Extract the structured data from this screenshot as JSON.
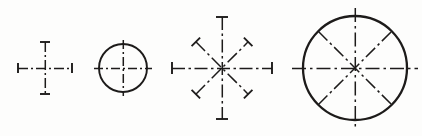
{
  "sheet": {
    "title": "Centerline and center-mark figures",
    "width": 422,
    "height": 136,
    "background_color": "#fdfdfc",
    "ink_color": "#1d1b1a"
  },
  "figures": [
    {
      "id": "fig-1",
      "name": "center-cross",
      "label": "Center cross with end ticks",
      "center": {
        "x": 45,
        "y": 68
      },
      "has_circle": false,
      "circle_radius": 0,
      "axes": [
        "horizontal",
        "vertical"
      ],
      "axis_half_length_h": 27,
      "axis_half_length_v": 26,
      "tick_half_length": 5,
      "end_marks": 4
    },
    {
      "id": "fig-2",
      "name": "small-circle-with-centerlines",
      "label": "Small circle with two centerlines",
      "center": {
        "x": 123,
        "y": 68
      },
      "has_circle": true,
      "circle_radius": 24,
      "axes": [
        "horizontal",
        "vertical"
      ],
      "axis_half_length_h": 29,
      "axis_half_length_v": 28,
      "tick_half_length": 0,
      "end_marks": 0
    },
    {
      "id": "fig-3",
      "name": "eight-spoke-star",
      "label": "Eight-spoke centerline star with end ticks",
      "center": {
        "x": 222,
        "y": 68
      },
      "has_circle": false,
      "circle_radius": 0,
      "axes": [
        "horizontal",
        "vertical",
        "diagonal-45",
        "diagonal-135"
      ],
      "axis_half_length_h": 50,
      "axis_half_length_v": 51,
      "axis_half_length_d": 37,
      "tick_half_length": 6,
      "end_marks": 8
    },
    {
      "id": "fig-4",
      "name": "large-circle-with-eight-centerlines",
      "label": "Large circle with eight centerlines",
      "center": {
        "x": 355,
        "y": 68
      },
      "has_circle": true,
      "circle_radius": 52,
      "axes": [
        "horizontal",
        "vertical",
        "diagonal-45",
        "diagonal-135"
      ],
      "axis_half_length_h": 63,
      "axis_half_length_v": 60,
      "axis_half_length_d": 52,
      "tick_half_length": 0,
      "end_marks": 0
    }
  ],
  "dash_patterns": {
    "long_dash_dot": "14 3.5 2.5 3.5",
    "short_dash_dot": "9 3 2 3",
    "fine_dash_dot": "7 2.5 1.5 2.5"
  }
}
